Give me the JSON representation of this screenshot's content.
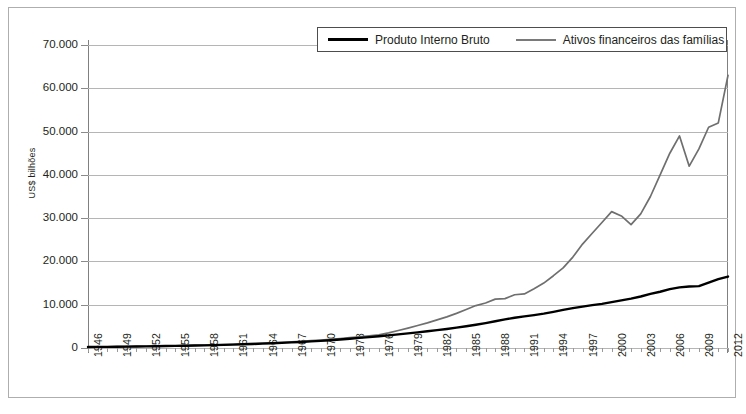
{
  "chart_data": {
    "type": "line",
    "title": "",
    "xlabel": "",
    "ylabel": "US$ bilhões",
    "ylim": [
      0,
      70000
    ],
    "xlim": [
      1946,
      2012
    ],
    "grid": true,
    "legend_position": "top-center",
    "y_ticks": [
      0,
      10000,
      20000,
      30000,
      40000,
      50000,
      60000,
      70000
    ],
    "y_tick_labels": [
      "0",
      "10.000",
      "20.000",
      "30.000",
      "40.000",
      "50.000",
      "60.000",
      "70.000"
    ],
    "x_tick_labels": [
      "1946",
      "1949",
      "1952",
      "1955",
      "1958",
      "1961",
      "1964",
      "1967",
      "1970",
      "1973",
      "1976",
      "1979",
      "1982",
      "1985",
      "1988",
      "1991",
      "1994",
      "1997",
      "2000",
      "2003",
      "2006",
      "2009",
      "2012"
    ],
    "x": [
      1946,
      1947,
      1948,
      1949,
      1950,
      1951,
      1952,
      1953,
      1954,
      1955,
      1956,
      1957,
      1958,
      1959,
      1960,
      1961,
      1962,
      1963,
      1964,
      1965,
      1966,
      1967,
      1968,
      1969,
      1970,
      1971,
      1972,
      1973,
      1974,
      1975,
      1976,
      1977,
      1978,
      1979,
      1980,
      1981,
      1982,
      1983,
      1984,
      1985,
      1986,
      1987,
      1988,
      1989,
      1990,
      1991,
      1992,
      1993,
      1994,
      1995,
      1996,
      1997,
      1998,
      1999,
      2000,
      2001,
      2002,
      2003,
      2004,
      2005,
      2006,
      2007,
      2008,
      2009,
      2010,
      2011,
      2012
    ],
    "series": [
      {
        "name": "Produto Interno Bruto",
        "color": "#000000",
        "values": [
          230,
          250,
          270,
          290,
          320,
          350,
          380,
          410,
          450,
          490,
          530,
          570,
          610,
          660,
          720,
          790,
          860,
          930,
          1010,
          1100,
          1190,
          1290,
          1400,
          1520,
          1650,
          1800,
          1960,
          2140,
          2330,
          2520,
          2720,
          2930,
          3150,
          3380,
          3620,
          3870,
          4130,
          4400,
          4700,
          5020,
          5380,
          5760,
          6170,
          6600,
          7000,
          7300,
          7600,
          7950,
          8350,
          8800,
          9200,
          9550,
          9900,
          10200,
          10600,
          11000,
          11400,
          11900,
          12500,
          13000,
          13600,
          14000,
          14200,
          14300,
          15100,
          15900,
          16500
        ]
      },
      {
        "name": "Ativos financeiros das famílias",
        "color": "#6f6f6f",
        "values": [
          250,
          270,
          290,
          310,
          340,
          370,
          400,
          440,
          480,
          520,
          570,
          620,
          670,
          730,
          800,
          870,
          950,
          1030,
          1120,
          1210,
          1320,
          1430,
          1560,
          1700,
          1850,
          2010,
          2190,
          2380,
          2590,
          2810,
          3050,
          3500,
          4050,
          4600,
          5200,
          5800,
          6500,
          7200,
          8000,
          8900,
          9800,
          10400,
          11300,
          11400,
          12300,
          12500,
          13700,
          15000,
          16700,
          18500,
          21000,
          24000,
          26500,
          29000,
          31500,
          30500,
          28500,
          31000,
          35000,
          40000,
          45000,
          49000,
          42000,
          46000,
          51000,
          52000,
          63000
        ]
      }
    ]
  },
  "legend": {
    "entries": [
      {
        "label": "Produto Interno Bruto",
        "style": "solid-black"
      },
      {
        "label": "Ativos financeiros das famílias",
        "style": "solid-gray"
      }
    ]
  },
  "axis": {
    "y_title": "US$ bilhões"
  },
  "colors": {
    "pib": "#000000",
    "ativos": "#6f6f6f",
    "gridline": "#b5b5b5",
    "frame": "#aeaeae",
    "text": "#231f20"
  }
}
